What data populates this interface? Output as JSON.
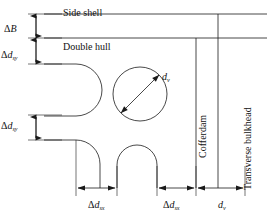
{
  "figure": {
    "type": "engineering-cross-section-diagram",
    "background_color": "#ffffff",
    "line_color": "#1a1a1a"
  },
  "region_labels": {
    "side_shell": "Side shell",
    "double_hull": "Double hull",
    "cofferdam": "Cofferdam",
    "transverse_bulkhead": "Transverse bulkhead"
  },
  "vertical_dimensions": [
    {
      "id": "delta-B",
      "symbol": "ΔB",
      "base": "B",
      "sub": "",
      "y_from": 14,
      "y_to": 38
    },
    {
      "id": "delta-dsy-upper",
      "symbol": "Δd",
      "base": "d",
      "sub": "sy",
      "y_from": 38,
      "y_to": 64
    },
    {
      "id": "delta-dsy-lower",
      "symbol": "Δd",
      "base": "d",
      "sub": "sy",
      "y_from": 115,
      "y_to": 140
    }
  ],
  "horizontal_dimensions": [
    {
      "id": "delta-dsx-left",
      "base": "d",
      "sub": "sx",
      "x_from": 76,
      "x_to": 117
    },
    {
      "id": "delta-dsx-right",
      "base": "d",
      "sub": "sx",
      "x_from": 156,
      "x_to": 196
    },
    {
      "id": "dv-bottom",
      "base": "d",
      "sub": "v",
      "x_from": 200,
      "x_to": 245
    }
  ],
  "circle_annotation": {
    "id": "vessel-diameter",
    "base": "d",
    "sub": "v",
    "center_x": 140,
    "center_y": 94,
    "radius": 27
  },
  "symbols": {
    "delta": "Δ",
    "d": "d",
    "B": "B",
    "sub_sy": "sy",
    "sub_sx": "sx",
    "sub_v": "v"
  }
}
